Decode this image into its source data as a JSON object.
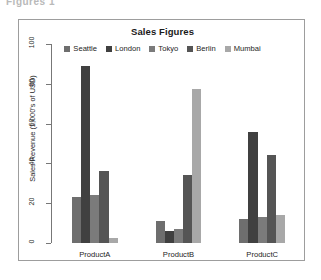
{
  "clipped_caption": "Figures 1",
  "figure": {
    "frame_color": "#9d9d9d",
    "background": "#ffffff"
  },
  "chart_data": {
    "type": "bar",
    "title": "Sales Figures",
    "subtitle": "",
    "xlabel": "",
    "ylabel": "Sales Revenue (1,000's of USD)",
    "grid": false,
    "legend_position": "top-center",
    "grouping": "grouped",
    "ylim": [
      0,
      100
    ],
    "yticks": [
      0,
      20,
      40,
      60,
      80,
      100
    ],
    "ytick_labels": [
      "0",
      "20",
      "40",
      "60",
      "80",
      "100"
    ],
    "categories": [
      "ProductA",
      "ProductB",
      "ProductC"
    ],
    "series": [
      {
        "name": "Seattle",
        "color": "#6e6e6e",
        "values": [
          23,
          11,
          12
        ]
      },
      {
        "name": "London",
        "color": "#404040",
        "values": [
          89,
          6,
          56
        ]
      },
      {
        "name": "Tokyo",
        "color": "#7b7b7b",
        "values": [
          24,
          7,
          13
        ]
      },
      {
        "name": "Berlin",
        "color": "#555555",
        "values": [
          36,
          34,
          44
        ]
      },
      {
        "name": "Mumbai",
        "color": "#a8a8a8",
        "values": [
          2.5,
          77.5,
          14
        ]
      }
    ]
  }
}
